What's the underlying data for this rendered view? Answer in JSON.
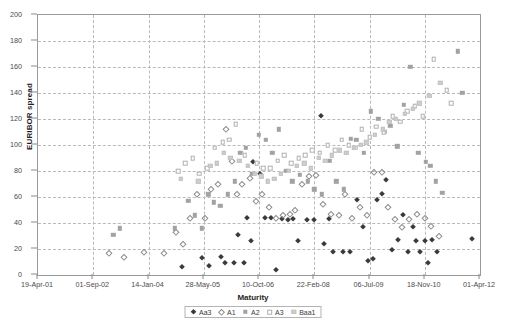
{
  "chart_data": {
    "type": "scatter",
    "title": "",
    "xlabel": "Maturity",
    "ylabel": "EURIBOR spread",
    "grid": true,
    "legend_position": "bottom",
    "ylim": [
      0,
      200
    ],
    "yticks": [
      0,
      20,
      40,
      60,
      80,
      100,
      120,
      140,
      160,
      180,
      200
    ],
    "xticks": [
      "19-Apr-01",
      "01-Sep-02",
      "14-Jan-04",
      "28-May-05",
      "10-Oct-06",
      "22-Feb-08",
      "06-Jul-09",
      "18-Nov-10",
      "01-Apr-12"
    ],
    "xlim": [
      0,
      8
    ],
    "series": [
      {
        "name": "Aa3",
        "marker": "filled-diamond",
        "color": "#3a3a3a",
        "points": [
          [
            2.6,
            6
          ],
          [
            2.97,
            13
          ],
          [
            3.1,
            7
          ],
          [
            3.32,
            14
          ],
          [
            3.38,
            9
          ],
          [
            3.55,
            9
          ],
          [
            3.72,
            9
          ],
          [
            3.62,
            31
          ],
          [
            3.78,
            44
          ],
          [
            3.86,
            26
          ],
          [
            3.9,
            87
          ],
          [
            4.02,
            78
          ],
          [
            4.1,
            44
          ],
          [
            4.22,
            44
          ],
          [
            4.3,
            4
          ],
          [
            4.42,
            43
          ],
          [
            4.52,
            42
          ],
          [
            4.62,
            43
          ],
          [
            4.7,
            26
          ],
          [
            4.86,
            42
          ],
          [
            5.0,
            42
          ],
          [
            5.12,
            122
          ],
          [
            5.18,
            24
          ],
          [
            5.26,
            43
          ],
          [
            5.34,
            18
          ],
          [
            5.52,
            18
          ],
          [
            5.64,
            18
          ],
          [
            5.78,
            58
          ],
          [
            5.88,
            37
          ],
          [
            5.98,
            11
          ],
          [
            6.06,
            12
          ],
          [
            6.14,
            58
          ],
          [
            6.22,
            62
          ],
          [
            6.3,
            73
          ],
          [
            6.4,
            19
          ],
          [
            6.52,
            27
          ],
          [
            6.6,
            46
          ],
          [
            6.7,
            18
          ],
          [
            6.78,
            37
          ],
          [
            6.84,
            26
          ],
          [
            6.92,
            18
          ],
          [
            7.0,
            26
          ],
          [
            7.06,
            9
          ],
          [
            7.14,
            27
          ],
          [
            7.22,
            18
          ],
          [
            7.86,
            28
          ]
        ]
      },
      {
        "name": "A1",
        "marker": "open-diamond",
        "color": "#8d8d8d",
        "points": [
          [
            1.28,
            17
          ],
          [
            1.55,
            14
          ],
          [
            1.92,
            18
          ],
          [
            2.28,
            17
          ],
          [
            2.5,
            33
          ],
          [
            2.62,
            24
          ],
          [
            2.76,
            44
          ],
          [
            2.88,
            62
          ],
          [
            3.02,
            44
          ],
          [
            3.14,
            66
          ],
          [
            3.26,
            70
          ],
          [
            3.4,
            112
          ],
          [
            3.52,
            88
          ],
          [
            3.6,
            62
          ],
          [
            3.7,
            70
          ],
          [
            3.84,
            75
          ],
          [
            3.94,
            57
          ],
          [
            4.06,
            62
          ],
          [
            4.18,
            52
          ],
          [
            4.3,
            44
          ],
          [
            4.44,
            46
          ],
          [
            4.56,
            47
          ],
          [
            4.66,
            50
          ],
          [
            4.78,
            70
          ],
          [
            4.9,
            76
          ],
          [
            5.04,
            77
          ],
          [
            5.16,
            55
          ],
          [
            5.3,
            47
          ],
          [
            5.44,
            46
          ],
          [
            5.56,
            62
          ],
          [
            5.68,
            44
          ],
          [
            5.82,
            52
          ],
          [
            5.96,
            46
          ],
          [
            6.08,
            79
          ],
          [
            6.22,
            79
          ],
          [
            6.34,
            52
          ],
          [
            6.46,
            43
          ],
          [
            6.58,
            37
          ],
          [
            6.72,
            43
          ],
          [
            6.86,
            47
          ],
          [
            7.0,
            44
          ],
          [
            7.12,
            38
          ],
          [
            7.26,
            30
          ]
        ]
      },
      {
        "name": "A2",
        "marker": "filled-square",
        "color": "#a2a2a2",
        "points": [
          [
            1.36,
            31
          ],
          [
            1.48,
            36
          ],
          [
            2.48,
            36
          ],
          [
            2.72,
            57
          ],
          [
            2.84,
            46
          ],
          [
            2.96,
            36
          ],
          [
            3.08,
            62
          ],
          [
            3.18,
            56
          ],
          [
            3.3,
            53
          ],
          [
            3.44,
            62
          ],
          [
            3.56,
            72
          ],
          [
            3.66,
            94
          ],
          [
            3.76,
            98
          ],
          [
            3.88,
            78
          ],
          [
            4.0,
            108
          ],
          [
            4.12,
            104
          ],
          [
            4.24,
            94
          ],
          [
            4.36,
            112
          ],
          [
            4.48,
            80
          ],
          [
            4.6,
            72
          ],
          [
            4.74,
            77
          ],
          [
            4.88,
            72
          ],
          [
            5.0,
            66
          ],
          [
            5.14,
            62
          ],
          [
            5.28,
            88
          ],
          [
            5.4,
            72
          ],
          [
            5.54,
            66
          ],
          [
            5.66,
            105
          ],
          [
            5.76,
            104
          ],
          [
            5.9,
            94
          ],
          [
            6.02,
            126
          ],
          [
            6.16,
            120
          ],
          [
            6.28,
            110
          ],
          [
            6.38,
            115
          ],
          [
            6.5,
            99
          ],
          [
            6.62,
            131
          ],
          [
            6.74,
            160
          ],
          [
            6.88,
            94
          ],
          [
            7.02,
            87
          ],
          [
            7.1,
            84
          ],
          [
            7.2,
            72
          ],
          [
            7.32,
            63
          ],
          [
            7.6,
            172
          ],
          [
            7.68,
            140
          ]
        ]
      },
      {
        "name": "A3",
        "marker": "open-square",
        "color": "#b0b0b0",
        "points": [
          [
            2.54,
            80
          ],
          [
            2.66,
            86
          ],
          [
            2.8,
            90
          ],
          [
            2.92,
            78
          ],
          [
            3.06,
            82
          ],
          [
            3.2,
            98
          ],
          [
            3.34,
            102
          ],
          [
            3.46,
            104
          ],
          [
            3.58,
            116
          ],
          [
            3.74,
            92
          ],
          [
            3.96,
            86
          ],
          [
            4.08,
            82
          ],
          [
            4.2,
            82
          ],
          [
            4.34,
            88
          ],
          [
            4.46,
            92
          ],
          [
            4.58,
            86
          ],
          [
            4.72,
            90
          ],
          [
            4.84,
            92
          ],
          [
            4.96,
            96
          ],
          [
            5.1,
            94
          ],
          [
            5.24,
            100
          ],
          [
            5.38,
            96
          ],
          [
            5.5,
            104
          ],
          [
            5.62,
            100
          ],
          [
            5.74,
            98
          ],
          [
            5.86,
            112
          ],
          [
            6.0,
            106
          ],
          [
            6.12,
            114
          ],
          [
            6.26,
            110
          ],
          [
            6.42,
            122
          ],
          [
            6.56,
            118
          ],
          [
            6.68,
            126
          ],
          [
            6.82,
            130
          ],
          [
            6.96,
            122
          ],
          [
            7.16,
            166
          ],
          [
            7.4,
            142
          ],
          [
            7.48,
            132
          ]
        ]
      },
      {
        "name": "Baa1",
        "marker": "light-square",
        "color": "#cfcfcf",
        "points": [
          [
            2.58,
            74
          ],
          [
            2.9,
            72
          ],
          [
            3.12,
            84
          ],
          [
            3.24,
            86
          ],
          [
            3.36,
            94
          ],
          [
            3.48,
            90
          ],
          [
            3.64,
            88
          ],
          [
            3.8,
            84
          ],
          [
            3.92,
            78
          ],
          [
            4.04,
            76
          ],
          [
            4.16,
            72
          ],
          [
            4.28,
            74
          ],
          [
            4.4,
            78
          ],
          [
            4.54,
            80
          ],
          [
            4.68,
            84
          ],
          [
            4.82,
            86
          ],
          [
            4.94,
            82
          ],
          [
            5.08,
            90
          ],
          [
            5.2,
            88
          ],
          [
            5.32,
            92
          ],
          [
            5.46,
            96
          ],
          [
            5.58,
            94
          ],
          [
            5.72,
            98
          ],
          [
            5.84,
            100
          ],
          [
            5.94,
            102
          ],
          [
            6.1,
            108
          ],
          [
            6.24,
            112
          ],
          [
            6.36,
            118
          ],
          [
            6.48,
            120
          ],
          [
            6.64,
            124
          ],
          [
            6.78,
            128
          ],
          [
            6.9,
            132
          ],
          [
            7.08,
            138
          ],
          [
            7.28,
            148
          ]
        ]
      }
    ]
  }
}
